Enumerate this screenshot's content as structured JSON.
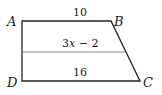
{
  "figure": {
    "type": "trapezoid",
    "vertices": {
      "A": {
        "label": "A",
        "x": 22,
        "y": 21
      },
      "B": {
        "label": "B",
        "x": 111,
        "y": 21
      },
      "C": {
        "label": "C",
        "x": 140,
        "y": 81
      },
      "D": {
        "label": "D",
        "x": 22,
        "y": 81
      }
    },
    "segments": {
      "top": {
        "label": "10"
      },
      "midline": {
        "label_coef": "3",
        "label_var": "x",
        "label_rest": " − 2"
      },
      "bottom": {
        "label": "16"
      }
    },
    "colors": {
      "stroke": "#222222",
      "midline": "#777777",
      "text": "#1a1a1a"
    }
  }
}
